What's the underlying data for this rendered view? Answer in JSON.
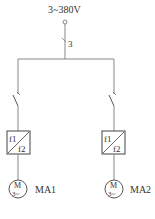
{
  "diagram": {
    "supply_label": "3~380V",
    "phase_count_label": "3",
    "branches": [
      {
        "converter": {
          "top_label": "f1",
          "bottom_label": "f2"
        },
        "motor": {
          "symbol_top": "M",
          "symbol_bottom": "3~",
          "label": "MA1"
        }
      },
      {
        "converter": {
          "top_label": "f1",
          "bottom_label": "f2"
        },
        "motor": {
          "symbol_top": "M",
          "symbol_bottom": "3~",
          "label": "MA2"
        }
      }
    ],
    "colors": {
      "line": "#888888",
      "text": "#333333"
    }
  }
}
